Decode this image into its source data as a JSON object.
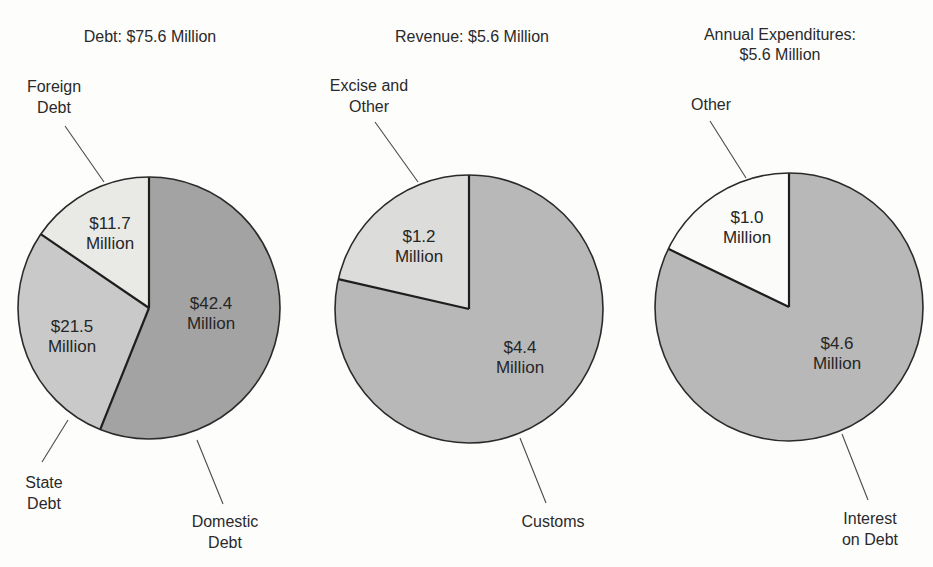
{
  "colors": {
    "outline": "#2a2a2a",
    "leader": "#4a4a4a",
    "dark_gray": "#a3a3a3",
    "mid_gray": "#c9c9c9",
    "light_gray": "#e9e9e6",
    "medium_gray": "#b8b8b8",
    "white": "#fbfbfa"
  },
  "chart_data": [
    {
      "type": "pie",
      "title": "Debt: $75.6 Million",
      "total": 75.6,
      "unit": "Million USD",
      "slices": [
        {
          "name": "Domestic Debt",
          "value": 42.4,
          "label": "$42.4\nMillion",
          "callout": "Domestic\nDebt",
          "color": "#a3a3a3"
        },
        {
          "name": "State Debt",
          "value": 21.5,
          "label": "$21.5\nMillion",
          "callout": "State\nDebt",
          "color": "#c9c9c9"
        },
        {
          "name": "Foreign Debt",
          "value": 11.7,
          "label": "$11.7\nMillion",
          "callout": "Foreign\nDebt",
          "color": "#e9e9e6"
        }
      ]
    },
    {
      "type": "pie",
      "title": "Revenue: $5.6 Million",
      "total": 5.6,
      "unit": "Million USD",
      "slices": [
        {
          "name": "Customs",
          "value": 4.4,
          "label": "$4.4\nMillion",
          "callout": "Customs",
          "color": "#b8b8b8"
        },
        {
          "name": "Excise and Other",
          "value": 1.2,
          "label": "$1.2\nMillion",
          "callout": "Excise and\nOther",
          "color": "#dcdcda"
        }
      ]
    },
    {
      "type": "pie",
      "title": "Annual Expenditures:\n$5.6 Million",
      "total": 5.6,
      "unit": "Million USD",
      "slices": [
        {
          "name": "Interest on Debt",
          "value": 4.6,
          "label": "$4.6\nMillion",
          "callout": "Interest\non Debt",
          "color": "#b8b8b8"
        },
        {
          "name": "Other",
          "value": 1.0,
          "label": "$1.0\nMillion",
          "callout": "Other",
          "color": "#fbfbfa"
        }
      ]
    }
  ],
  "charts": [
    {
      "title": "Debt: $75.6 Million",
      "labels": [
        "$42.4\nMillion",
        "$21.5\nMillion",
        "$11.7\nMillion"
      ],
      "callouts": [
        "Domestic\nDebt",
        "State\nDebt",
        "Foreign\nDebt"
      ]
    },
    {
      "title": "Revenue: $5.6 Million",
      "labels": [
        "$4.4\nMillion",
        "$1.2\nMillion"
      ],
      "callouts": [
        "Customs",
        "Excise and\nOther"
      ]
    },
    {
      "title": "Annual Expenditures:\n$5.6 Million",
      "labels": [
        "$4.6\nMillion",
        "$1.0\nMillion"
      ],
      "callouts": [
        "Interest\non Debt",
        "Other"
      ]
    }
  ]
}
